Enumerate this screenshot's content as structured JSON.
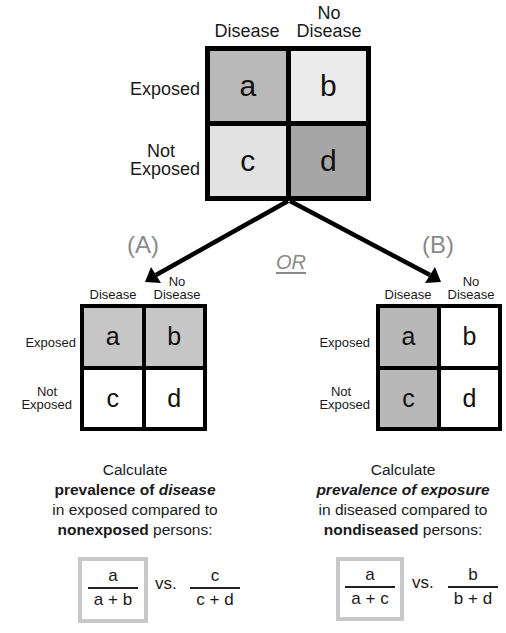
{
  "top_table": {
    "col_headers": {
      "disease": "Disease",
      "no_disease_line1": "No",
      "no_disease_line2": "Disease"
    },
    "row_headers": {
      "exposed": "Exposed",
      "not_exposed_line1": "Not",
      "not_exposed_line2": "Exposed"
    },
    "cells": [
      {
        "label": "a",
        "color": "#b9b9b9"
      },
      {
        "label": "b",
        "color": "#ececec"
      },
      {
        "label": "c",
        "color": "#e2e2e2"
      },
      {
        "label": "d",
        "color": "#a6a6a6"
      }
    ]
  },
  "connector": {
    "or_label": "OR",
    "left_label": "(A)",
    "right_label": "(B)"
  },
  "panel_a": {
    "col_headers": {
      "disease": "Disease",
      "no_disease_line1": "No",
      "no_disease_line2": "Disease"
    },
    "row_headers": {
      "exposed": "Exposed",
      "not_exposed_line1": "Not",
      "not_exposed_line2": "Exposed"
    },
    "cells": [
      {
        "label": "a",
        "color": "#c6c6c6"
      },
      {
        "label": "b",
        "color": "#c6c6c6"
      },
      {
        "label": "c",
        "color": "#ffffff"
      },
      {
        "label": "d",
        "color": "#ffffff"
      }
    ],
    "description": {
      "line1": "Calculate",
      "line2_bold": "prevalence of ",
      "line2_bold_italic": "disease",
      "line3": "in exposed compared to",
      "line4_bold": "nonexposed",
      "line4_rest": " persons:"
    },
    "formula": {
      "left": {
        "numerator": "a",
        "denominator": "a + b"
      },
      "vs": "vs.",
      "right": {
        "numerator": "c",
        "denominator": "c + d"
      }
    }
  },
  "panel_b": {
    "col_headers": {
      "disease": "Disease",
      "no_disease_line1": "No",
      "no_disease_line2": "Disease"
    },
    "row_headers": {
      "exposed": "Exposed",
      "not_exposed_line1": "Not",
      "not_exposed_line2": "Exposed"
    },
    "cells": [
      {
        "label": "a",
        "color": "#b8b8b8"
      },
      {
        "label": "b",
        "color": "#ffffff"
      },
      {
        "label": "c",
        "color": "#b8b8b8"
      },
      {
        "label": "d",
        "color": "#ffffff"
      }
    ],
    "description": {
      "line1": "Calculate",
      "line2_bold_italic": "prevalence of exposure",
      "line3": "in diseased compared to",
      "line4_bold": "nondiseased",
      "line4_rest": " persons:"
    },
    "formula": {
      "left": {
        "numerator": "a",
        "denominator": "a + c"
      },
      "vs": "vs.",
      "right": {
        "numerator": "b",
        "denominator": "b + d"
      }
    }
  },
  "colors": {
    "border": "#000000",
    "formula_box_border": "#c8c8c8",
    "label_gray": "#8a8a8a"
  }
}
